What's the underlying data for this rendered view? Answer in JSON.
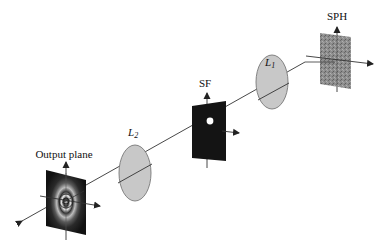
{
  "diagram": {
    "type": "optical-setup",
    "elements": [
      {
        "id": "output-plane",
        "label": "Output plane",
        "kind": "plane-rings"
      },
      {
        "id": "lens-l2",
        "label": "L",
        "subscript": "2",
        "kind": "lens"
      },
      {
        "id": "spatial-filter",
        "label": "SF",
        "kind": "plane-pinhole"
      },
      {
        "id": "lens-l1",
        "label": "L",
        "subscript": "1",
        "kind": "lens"
      },
      {
        "id": "sph",
        "label": "SPH",
        "kind": "plane-speckle"
      }
    ],
    "colors": {
      "lens_fill": "#c8c8c8",
      "sf_fill": "#111111",
      "sph_fill": "#8a8a8a",
      "line": "#333333"
    }
  }
}
